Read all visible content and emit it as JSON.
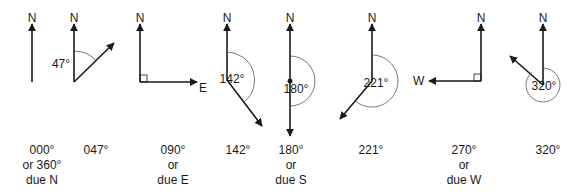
{
  "diagram": {
    "north_label": "N",
    "colors": {
      "line": "#1a1a1a",
      "arc": "#555555",
      "background": "#ffffff"
    },
    "figures": [
      {
        "id": "fig-000",
        "angle_label": "",
        "direction_label": "",
        "caption": [
          "000°",
          "or 360°",
          "due N"
        ]
      },
      {
        "id": "fig-047",
        "angle_label": "47°",
        "direction_label": "",
        "caption": [
          "047°"
        ]
      },
      {
        "id": "fig-090",
        "angle_label": "",
        "direction_label": "E",
        "caption": [
          "090°",
          "or",
          "due E"
        ]
      },
      {
        "id": "fig-142",
        "angle_label": "142°",
        "direction_label": "",
        "caption": [
          "142°"
        ]
      },
      {
        "id": "fig-180",
        "angle_label": "180°",
        "direction_label": "",
        "caption": [
          "180°",
          "or",
          "due S"
        ]
      },
      {
        "id": "fig-221",
        "angle_label": "221°",
        "direction_label": "",
        "caption": [
          "221°"
        ]
      },
      {
        "id": "fig-270",
        "angle_label": "",
        "direction_label": "W",
        "caption": [
          "270°",
          "or",
          "due W"
        ]
      },
      {
        "id": "fig-320",
        "angle_label": "320°",
        "direction_label": "",
        "caption": [
          "320°"
        ]
      }
    ]
  }
}
